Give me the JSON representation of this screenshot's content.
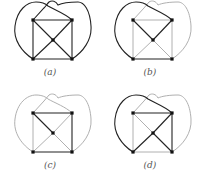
{
  "figure": {
    "colors": {
      "dark": "#222222",
      "light": "#b0b0b0",
      "node": "#111111",
      "background": "#ffffff"
    },
    "nodes": {
      "TL": [
        33,
        20
      ],
      "TR": [
        72,
        20
      ],
      "C": [
        53,
        40
      ],
      "BL": [
        33,
        59
      ],
      "BR": [
        72,
        59
      ]
    },
    "panels": [
      {
        "id": "a",
        "caption": "(a)",
        "offset": [
          0,
          0
        ],
        "dark_edges": [
          "TL-TR",
          "TL-BL",
          "TR-BR",
          "BL-BR",
          "TL-C",
          "TR-C",
          "BL-C",
          "BR-C",
          "curve-left",
          "curve-right"
        ],
        "light_edges": []
      },
      {
        "id": "b",
        "caption": "(b)",
        "offset": [
          100,
          0
        ],
        "dark_edges": [
          "TL-C",
          "TR-C",
          "BL-BR",
          "curve-left"
        ],
        "light_edges": [
          "TL-TR",
          "TL-BL",
          "TR-BR",
          "BL-C",
          "BR-C",
          "curve-right"
        ]
      },
      {
        "id": "c",
        "caption": "(c)",
        "offset": [
          0,
          93
        ],
        "dark_edges": [
          "TL-C",
          "BL-BR",
          "TR-BR",
          "TL-TR"
        ],
        "light_edges": [
          "TL-BL",
          "TR-C",
          "BL-C",
          "BR-C",
          "curve-left",
          "curve-right"
        ]
      },
      {
        "id": "d",
        "caption": "(d)",
        "offset": [
          100,
          93
        ],
        "dark_edges": [
          "TL-TR",
          "TR-C",
          "BL-C",
          "BR-C",
          "TR-BR",
          "curve-left"
        ],
        "light_edges": [
          "TL-C",
          "TL-BL",
          "BL-BR",
          "curve-right"
        ]
      }
    ]
  }
}
